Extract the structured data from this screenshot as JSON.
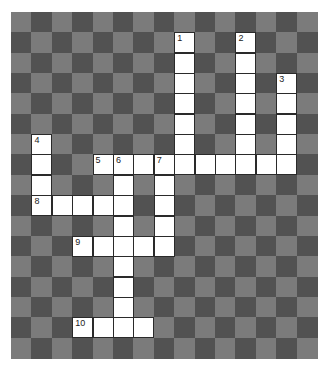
{
  "puzzle": {
    "rows": 17,
    "cols": 15,
    "colors": {
      "light": "#7b7b7b",
      "dark": "#525252",
      "cell": "#ffffff",
      "border": "#2a2a2a"
    },
    "entries": [
      {
        "number": "1",
        "direction": "down",
        "row": 1,
        "col": 8,
        "length": 7
      },
      {
        "number": "2",
        "direction": "down",
        "row": 1,
        "col": 11,
        "length": 7
      },
      {
        "number": "3",
        "direction": "down",
        "row": 3,
        "col": 13,
        "length": 5
      },
      {
        "number": "4",
        "direction": "down",
        "row": 6,
        "col": 1,
        "length": 4
      },
      {
        "number": "5",
        "direction": "across",
        "row": 7,
        "col": 4,
        "length": 10
      },
      {
        "number": "6",
        "direction": "down",
        "row": 7,
        "col": 5,
        "length": 9
      },
      {
        "number": "7",
        "direction": "down",
        "row": 7,
        "col": 7,
        "length": 5
      },
      {
        "number": "8",
        "direction": "across",
        "row": 9,
        "col": 1,
        "length": 5
      },
      {
        "number": "9",
        "direction": "across",
        "row": 11,
        "col": 3,
        "length": 5
      },
      {
        "number": "10",
        "direction": "across",
        "row": 15,
        "col": 3,
        "length": 4
      }
    ]
  }
}
